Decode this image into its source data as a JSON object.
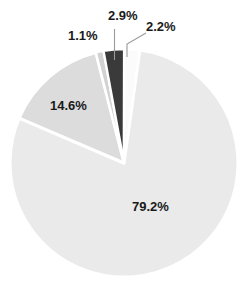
{
  "chart_data": {
    "type": "pie",
    "title": "",
    "subtitle": "",
    "xlabel": "",
    "ylabel": "",
    "grid": false,
    "legend": "none",
    "labels_inside": true,
    "label_format": "percent",
    "start_angle_deg": -82,
    "direction": "clockwise",
    "separator_color": "#ffffff",
    "separator_width_px": 3,
    "categories": [
      "Slice A",
      "Slice B",
      "Slice C",
      "Slice D",
      "Slice E"
    ],
    "values": [
      79.2,
      14.6,
      1.1,
      2.9,
      2.2
    ],
    "value_labels": [
      "79.2%",
      "14.6%",
      "1.1%",
      "2.9%",
      "2.2%"
    ],
    "colors": [
      "#eaeaea",
      "#dcdcdc",
      "#d2d2d2",
      "#3a3a3a",
      "#fbfbfb"
    ],
    "series": [
      {
        "name": "share",
        "values": [
          79.2,
          14.6,
          1.1,
          2.9,
          2.2
        ]
      }
    ]
  },
  "pie": {
    "center_x": 124,
    "center_y": 163,
    "radius": 114,
    "slices": [
      {
        "key": "s-79",
        "value": 79.2,
        "label": "79.2%",
        "color": "#eaeaea",
        "label_position": "inside"
      },
      {
        "key": "s-146",
        "value": 14.6,
        "label": "14.6%",
        "color": "#dcdcdc",
        "label_position": "inside"
      },
      {
        "key": "s-11",
        "value": 1.1,
        "label": "1.1%",
        "color": "#d2d2d2",
        "label_position": "outside"
      },
      {
        "key": "s-29",
        "value": 2.9,
        "label": "2.9%",
        "color": "#3a3a3a",
        "label_position": "outside-leader"
      },
      {
        "key": "s-22",
        "value": 2.2,
        "label": "2.2%",
        "color": "#fbfbfb",
        "label_position": "outside-leader"
      }
    ],
    "leader_line_color": "#9a9a9a"
  }
}
